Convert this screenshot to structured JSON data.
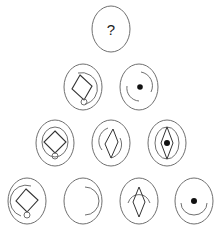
{
  "puzzle": {
    "type": "triangular figure-reasoning puzzle",
    "stroke_color": "#6f6f6f",
    "shape_color": "#333333",
    "dot_color": "#111111",
    "question_mark": "?",
    "rows": [
      {
        "row": 1,
        "cells": [
          {
            "id": "r1c1",
            "content": "question",
            "elements": [
              "outer-ellipse",
              "question-mark"
            ]
          }
        ]
      },
      {
        "row": 2,
        "cells": [
          {
            "id": "r2c1",
            "elements": [
              "outer-ellipse",
              "tilted-square",
              "inner-arc-right",
              "small-circle-bottom"
            ]
          },
          {
            "id": "r2c2",
            "elements": [
              "outer-ellipse",
              "arc-upper-right",
              "arc-lower-left",
              "center-dot"
            ]
          }
        ]
      },
      {
        "row": 3,
        "cells": [
          {
            "id": "r3c1",
            "elements": [
              "outer-ellipse",
              "inner-ellipse",
              "diamond-square",
              "small-circle-bottom"
            ]
          },
          {
            "id": "r3c2",
            "elements": [
              "outer-ellipse",
              "narrow-diamond",
              "arc-upper-left",
              "arc-lower-right"
            ]
          },
          {
            "id": "r3c3",
            "elements": [
              "outer-ellipse",
              "inner-ellipse",
              "narrow-diamond",
              "center-dot"
            ]
          }
        ]
      },
      {
        "row": 4,
        "cells": [
          {
            "id": "r4c1",
            "elements": [
              "outer-ellipse",
              "inner-arc-left",
              "diamond-square",
              "small-circle-bottom"
            ]
          },
          {
            "id": "r4c2",
            "elements": [
              "outer-ellipse",
              "arc-right"
            ]
          },
          {
            "id": "r4c3",
            "elements": [
              "outer-ellipse",
              "arc-top",
              "narrow-diamond"
            ]
          },
          {
            "id": "r4c4",
            "elements": [
              "outer-ellipse",
              "arc-bottom",
              "center-dot"
            ]
          }
        ]
      }
    ]
  }
}
